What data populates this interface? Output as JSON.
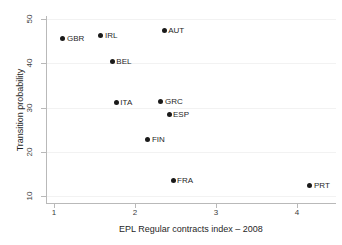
{
  "chart_data": {
    "type": "scatter",
    "title": "",
    "subtitle": "",
    "xlabel": "EPL Regular contracts index – 2008",
    "ylabel": "Transition probability",
    "xlim": [
      0.85,
      4.45
    ],
    "ylim": [
      8.5,
      51.5
    ],
    "xticks": [
      1,
      2,
      3,
      4
    ],
    "xtick_labels": [
      "1",
      "2",
      "3",
      "4"
    ],
    "yticks": [
      10,
      20,
      30,
      40,
      50
    ],
    "ytick_labels": [
      "10",
      "20",
      "30",
      "40",
      "50"
    ],
    "grid": "horizontal",
    "legend": "none",
    "marker_color": "#1a1a1a",
    "axis_color": "#b9b9b9",
    "grid_color": "#f2f2f2",
    "label_position": "right",
    "points": [
      {
        "label": "GBR",
        "x": 1.11,
        "y": 45.6
      },
      {
        "label": "IRL",
        "x": 1.58,
        "y": 46.3
      },
      {
        "label": "BEL",
        "x": 1.72,
        "y": 40.4
      },
      {
        "label": "ITA",
        "x": 1.77,
        "y": 31.2
      },
      {
        "label": "FIN",
        "x": 2.16,
        "y": 22.8
      },
      {
        "label": "GRC",
        "x": 2.32,
        "y": 31.4
      },
      {
        "label": "AUT",
        "x": 2.36,
        "y": 47.4
      },
      {
        "label": "ESP",
        "x": 2.42,
        "y": 28.5
      },
      {
        "label": "FRA",
        "x": 2.47,
        "y": 13.6
      },
      {
        "label": "PRT",
        "x": 4.16,
        "y": 12.3
      }
    ]
  }
}
